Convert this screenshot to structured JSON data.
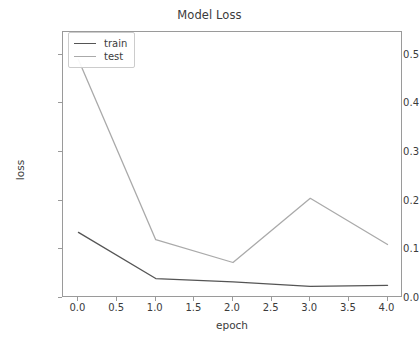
{
  "chart_data": {
    "type": "line",
    "title": "Model Loss",
    "xlabel": "epoch",
    "ylabel": "loss",
    "x": [
      0.0,
      1.0,
      2.0,
      3.0,
      4.0
    ],
    "series": [
      {
        "name": "train",
        "color": "#555555",
        "values": [
          0.135,
          0.04,
          0.033,
          0.024,
          0.026
        ]
      },
      {
        "name": "test",
        "color": "#aaaaaa",
        "values": [
          0.49,
          0.12,
          0.073,
          0.205,
          0.11
        ]
      }
    ],
    "xlim": [
      -0.2,
      4.2
    ],
    "ylim": [
      0.0,
      0.547
    ],
    "xticks": [
      0.0,
      0.5,
      1.0,
      1.5,
      2.0,
      2.5,
      3.0,
      3.5,
      4.0
    ],
    "xtick_labels": [
      "0.0",
      "0.5",
      "1.0",
      "1.5",
      "2.0",
      "2.5",
      "3.0",
      "3.5",
      "4.0"
    ],
    "yticks": [
      0.0,
      0.1,
      0.2,
      0.3,
      0.4,
      0.5
    ],
    "ytick_labels": [
      "0.0",
      "0.1",
      "0.2",
      "0.3",
      "0.4",
      "0.5"
    ],
    "grid": false,
    "legend_position": "upper left",
    "legend_entries": [
      "train",
      "test"
    ]
  }
}
